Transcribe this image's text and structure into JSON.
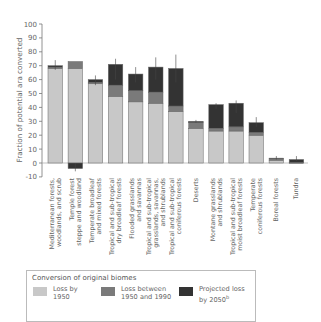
{
  "chart_data": {
    "type": "bar",
    "stacked": true,
    "title": "",
    "xlabel": "",
    "ylabel": "Fraction of potential ara converted",
    "ylim": [
      -10,
      100
    ],
    "yticks": [
      -10,
      0,
      10,
      20,
      30,
      40,
      50,
      60,
      70,
      80,
      90,
      100
    ],
    "grid": false,
    "legend_position": "bottom",
    "categories": [
      "Mediterranean forests, woodlands, and scrub",
      "Temple forest steppe and woodland",
      "Temperate broadleaf and mixed forests",
      "Tropical and sub-tropical dry broadleaf forests",
      "Flooded grasslands and savannas",
      "Tropical and sub-tropical grasslands, savannas, and shrublands",
      "Tropical and sub-tropical coniferous forests",
      "Deserts",
      "Montane grasslands and shrublands",
      "Tropical and sub-tropical moist broadleaf forests",
      "Temperate coniferous forests",
      "Boreal forests",
      "Tundra"
    ],
    "category_label_lines": [
      [
        "Mediterranean forests,",
        "woodlands, and scrub"
      ],
      [
        "Temple forest",
        "steppe and woodland"
      ],
      [
        "Temperate broadleaf",
        "and mixed forests"
      ],
      [
        "Tropical and sub-tropical",
        "dry broadleaf forests"
      ],
      [
        "Flooded grasslands",
        "and savannas"
      ],
      [
        "Tropical and sub-tropical",
        "grasslands, savannas,",
        "and shrublands"
      ],
      [
        "Tropical and sub-tropical",
        "coniferous forests"
      ],
      [
        "Deserts"
      ],
      [
        "Montane grasslands",
        "and shrublands"
      ],
      [
        "Tropical and sub-tropical",
        "moist broadleaf forests"
      ],
      [
        "Temperate",
        "coniferous forests"
      ],
      [
        "Boreal forests"
      ],
      [
        "Tundra"
      ]
    ],
    "series": [
      {
        "name": "Loss by 1950",
        "color": "#c8c8c8",
        "values": [
          68,
          68,
          57,
          48,
          44,
          43,
          37,
          25,
          23,
          23,
          20,
          2,
          0
        ]
      },
      {
        "name": "Loss between 1950 and 1990",
        "color": "#7a7a7a",
        "values": [
          1,
          5,
          1,
          8,
          8,
          8,
          4,
          4,
          2,
          3,
          2,
          1,
          0.5
        ]
      },
      {
        "name": "Projected loss by 2050",
        "color": "#333333",
        "values": [
          1,
          -4,
          2,
          15,
          12,
          18,
          27,
          1,
          17,
          17,
          7,
          0.5,
          2
        ]
      }
    ],
    "error_bars_top": [
      74,
      null,
      63,
      75,
      69,
      76,
      78,
      31,
      43,
      45,
      33,
      5,
      5
    ],
    "error_bars_bottom": [
      67,
      -6,
      56,
      60,
      58,
      60,
      58,
      29,
      39,
      36,
      26,
      2.5,
      1.5
    ]
  },
  "legend": {
    "title": "Conversion of original biomes",
    "items": [
      {
        "label": "Loss by\n1950",
        "color": "#c8c8c8"
      },
      {
        "label": "Loss between\n1950 and 1990",
        "color": "#7a7a7a"
      },
      {
        "label": "Projected loss\nby 2050",
        "sup": "b",
        "color": "#333333"
      }
    ]
  }
}
